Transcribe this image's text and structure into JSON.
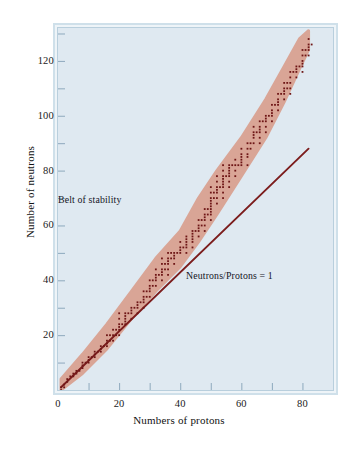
{
  "chart_data": {
    "type": "scatter",
    "title": "",
    "subtitle": "",
    "xlabel": "Numbers of protons",
    "ylabel": "Number of neutrons",
    "xlim": [
      0,
      90
    ],
    "ylim": [
      0,
      132
    ],
    "xticks": [
      0,
      10,
      20,
      30,
      40,
      50,
      60,
      70,
      80,
      90
    ],
    "xticklabels": [
      "0",
      "",
      "20",
      "",
      "40",
      "",
      "60",
      "",
      "80",
      ""
    ],
    "yticks": [
      0,
      10,
      20,
      30,
      40,
      50,
      60,
      70,
      80,
      90,
      100,
      110,
      120,
      130
    ],
    "yticklabels": [
      "",
      "",
      "20",
      "",
      "40",
      "",
      "60",
      "",
      "80",
      "",
      "100",
      "",
      "120",
      ""
    ],
    "grid": false,
    "legend_position": "none",
    "annotations": [
      {
        "text": "Belt of stability",
        "x": 17,
        "y": 70
      },
      {
        "text": "Neutrons/Protons = 1",
        "x": 48,
        "y": 44
      }
    ],
    "series": [
      {
        "name": "Neutrons/Protons = 1",
        "type": "line",
        "color": "#7c1d1d",
        "x": [
          1,
          82
        ],
        "y": [
          1,
          88
        ]
      },
      {
        "name": "Belt of stability band",
        "type": "area",
        "color": "#d9a08f",
        "upper_x": [
          1,
          8,
          16,
          24,
          32,
          40,
          46,
          52,
          60,
          68,
          74,
          79,
          82
        ],
        "upper_y": [
          4,
          13,
          24,
          36,
          48,
          58,
          70,
          80,
          92,
          106,
          118,
          128,
          131
        ],
        "lower_x": [
          1,
          8,
          16,
          24,
          32,
          40,
          46,
          52,
          60,
          68,
          74,
          79,
          82
        ],
        "lower_y": [
          0,
          6,
          15,
          26,
          36,
          45,
          54,
          64,
          78,
          92,
          105,
          117,
          124
        ]
      },
      {
        "name": "Stable nuclides",
        "type": "scatter",
        "color": "#6e1616",
        "marker": "square",
        "points": [
          [
            1,
            0
          ],
          [
            1,
            1
          ],
          [
            2,
            1
          ],
          [
            2,
            2
          ],
          [
            3,
            3
          ],
          [
            3,
            4
          ],
          [
            4,
            5
          ],
          [
            5,
            5
          ],
          [
            5,
            6
          ],
          [
            6,
            6
          ],
          [
            6,
            7
          ],
          [
            7,
            7
          ],
          [
            8,
            8
          ],
          [
            8,
            9
          ],
          [
            8,
            10
          ],
          [
            9,
            10
          ],
          [
            10,
            10
          ],
          [
            10,
            11
          ],
          [
            10,
            12
          ],
          [
            11,
            12
          ],
          [
            12,
            12
          ],
          [
            12,
            13
          ],
          [
            12,
            14
          ],
          [
            13,
            14
          ],
          [
            14,
            14
          ],
          [
            14,
            15
          ],
          [
            14,
            16
          ],
          [
            15,
            16
          ],
          [
            16,
            16
          ],
          [
            16,
            17
          ],
          [
            16,
            18
          ],
          [
            16,
            20
          ],
          [
            17,
            18
          ],
          [
            17,
            20
          ],
          [
            18,
            18
          ],
          [
            18,
            20
          ],
          [
            18,
            22
          ],
          [
            19,
            20
          ],
          [
            19,
            22
          ],
          [
            20,
            20
          ],
          [
            20,
            22
          ],
          [
            20,
            23
          ],
          [
            20,
            24
          ],
          [
            20,
            26
          ],
          [
            20,
            28
          ],
          [
            21,
            24
          ],
          [
            22,
            24
          ],
          [
            22,
            25
          ],
          [
            22,
            26
          ],
          [
            22,
            27
          ],
          [
            22,
            28
          ],
          [
            23,
            28
          ],
          [
            24,
            26
          ],
          [
            24,
            28
          ],
          [
            24,
            29
          ],
          [
            24,
            30
          ],
          [
            25,
            30
          ],
          [
            26,
            28
          ],
          [
            26,
            30
          ],
          [
            26,
            31
          ],
          [
            26,
            32
          ],
          [
            27,
            32
          ],
          [
            28,
            30
          ],
          [
            28,
            32
          ],
          [
            28,
            33
          ],
          [
            28,
            34
          ],
          [
            28,
            36
          ],
          [
            29,
            34
          ],
          [
            29,
            36
          ],
          [
            30,
            34
          ],
          [
            30,
            36
          ],
          [
            30,
            37
          ],
          [
            30,
            38
          ],
          [
            30,
            40
          ],
          [
            31,
            38
          ],
          [
            31,
            40
          ],
          [
            32,
            38
          ],
          [
            32,
            40
          ],
          [
            32,
            41
          ],
          [
            32,
            42
          ],
          [
            32,
            44
          ],
          [
            33,
            42
          ],
          [
            34,
            40
          ],
          [
            34,
            42
          ],
          [
            34,
            43
          ],
          [
            34,
            44
          ],
          [
            34,
            46
          ],
          [
            34,
            48
          ],
          [
            35,
            44
          ],
          [
            35,
            46
          ],
          [
            36,
            42
          ],
          [
            36,
            44
          ],
          [
            36,
            46
          ],
          [
            36,
            47
          ],
          [
            36,
            48
          ],
          [
            36,
            50
          ],
          [
            37,
            48
          ],
          [
            37,
            50
          ],
          [
            38,
            46
          ],
          [
            38,
            48
          ],
          [
            38,
            49
          ],
          [
            38,
            50
          ],
          [
            39,
            50
          ],
          [
            40,
            50
          ],
          [
            40,
            51
          ],
          [
            40,
            52
          ],
          [
            40,
            54
          ],
          [
            41,
            52
          ],
          [
            42,
            50
          ],
          [
            42,
            52
          ],
          [
            42,
            53
          ],
          [
            42,
            54
          ],
          [
            42,
            55
          ],
          [
            42,
            56
          ],
          [
            44,
            52
          ],
          [
            44,
            54
          ],
          [
            44,
            55
          ],
          [
            44,
            56
          ],
          [
            44,
            57
          ],
          [
            44,
            58
          ],
          [
            45,
            58
          ],
          [
            46,
            56
          ],
          [
            46,
            58
          ],
          [
            46,
            59
          ],
          [
            46,
            60
          ],
          [
            46,
            62
          ],
          [
            47,
            60
          ],
          [
            47,
            62
          ],
          [
            48,
            58
          ],
          [
            48,
            60
          ],
          [
            48,
            62
          ],
          [
            48,
            63
          ],
          [
            48,
            64
          ],
          [
            48,
            66
          ],
          [
            49,
            64
          ],
          [
            49,
            66
          ],
          [
            50,
            62
          ],
          [
            50,
            64
          ],
          [
            50,
            65
          ],
          [
            50,
            66
          ],
          [
            50,
            67
          ],
          [
            50,
            68
          ],
          [
            50,
            69
          ],
          [
            50,
            70
          ],
          [
            50,
            72
          ],
          [
            50,
            74
          ],
          [
            51,
            70
          ],
          [
            51,
            72
          ],
          [
            52,
            68
          ],
          [
            52,
            70
          ],
          [
            52,
            72
          ],
          [
            52,
            73
          ],
          [
            52,
            74
          ],
          [
            52,
            76
          ],
          [
            52,
            78
          ],
          [
            53,
            74
          ],
          [
            54,
            70
          ],
          [
            54,
            72
          ],
          [
            54,
            74
          ],
          [
            54,
            75
          ],
          [
            54,
            76
          ],
          [
            54,
            77
          ],
          [
            54,
            78
          ],
          [
            54,
            80
          ],
          [
            54,
            82
          ],
          [
            55,
            78
          ],
          [
            56,
            74
          ],
          [
            56,
            76
          ],
          [
            56,
            78
          ],
          [
            56,
            79
          ],
          [
            56,
            80
          ],
          [
            56,
            81
          ],
          [
            56,
            82
          ],
          [
            57,
            82
          ],
          [
            58,
            78
          ],
          [
            58,
            80
          ],
          [
            58,
            82
          ],
          [
            58,
            84
          ],
          [
            59,
            82
          ],
          [
            60,
            82
          ],
          [
            60,
            83
          ],
          [
            60,
            84
          ],
          [
            60,
            85
          ],
          [
            60,
            86
          ],
          [
            60,
            88
          ],
          [
            62,
            82
          ],
          [
            62,
            85
          ],
          [
            62,
            86
          ],
          [
            62,
            88
          ],
          [
            62,
            90
          ],
          [
            63,
            88
          ],
          [
            63,
            90
          ],
          [
            64,
            90
          ],
          [
            64,
            92
          ],
          [
            64,
            93
          ],
          [
            64,
            94
          ],
          [
            64,
            96
          ],
          [
            65,
            94
          ],
          [
            66,
            90
          ],
          [
            66,
            92
          ],
          [
            66,
            94
          ],
          [
            66,
            95
          ],
          [
            66,
            96
          ],
          [
            66,
            98
          ],
          [
            67,
            98
          ],
          [
            68,
            94
          ],
          [
            68,
            96
          ],
          [
            68,
            98
          ],
          [
            68,
            99
          ],
          [
            68,
            100
          ],
          [
            69,
            100
          ],
          [
            70,
            98
          ],
          [
            70,
            100
          ],
          [
            70,
            101
          ],
          [
            70,
            102
          ],
          [
            70,
            104
          ],
          [
            71,
            104
          ],
          [
            72,
            102
          ],
          [
            72,
            104
          ],
          [
            72,
            105
          ],
          [
            72,
            106
          ],
          [
            72,
            108
          ],
          [
            73,
            108
          ],
          [
            74,
            106
          ],
          [
            74,
            108
          ],
          [
            74,
            109
          ],
          [
            74,
            110
          ],
          [
            74,
            112
          ],
          [
            75,
            110
          ],
          [
            75,
            112
          ],
          [
            76,
            108
          ],
          [
            76,
            110
          ],
          [
            76,
            112
          ],
          [
            76,
            114
          ],
          [
            76,
            116
          ],
          [
            77,
            116
          ],
          [
            78,
            114
          ],
          [
            78,
            116
          ],
          [
            78,
            117
          ],
          [
            78,
            118
          ],
          [
            79,
            118
          ],
          [
            80,
            116
          ],
          [
            80,
            118
          ],
          [
            80,
            119
          ],
          [
            80,
            120
          ],
          [
            80,
            122
          ],
          [
            80,
            124
          ],
          [
            81,
            122
          ],
          [
            81,
            124
          ],
          [
            82,
            122
          ],
          [
            82,
            124
          ],
          [
            82,
            125
          ],
          [
            82,
            126
          ],
          [
            82,
            128
          ],
          [
            83,
            126
          ]
        ]
      }
    ]
  },
  "colors": {
    "plot_background": "#dfe9f1",
    "frame_border_outer": "#cfe0ea",
    "frame_border_inner": "#b9cfdd",
    "belt_fill": "#d9a08f",
    "line_color": "#7c1d1d",
    "dot_color": "#6e1616",
    "text_color": "#14141e",
    "page_background": "#ffffff"
  }
}
